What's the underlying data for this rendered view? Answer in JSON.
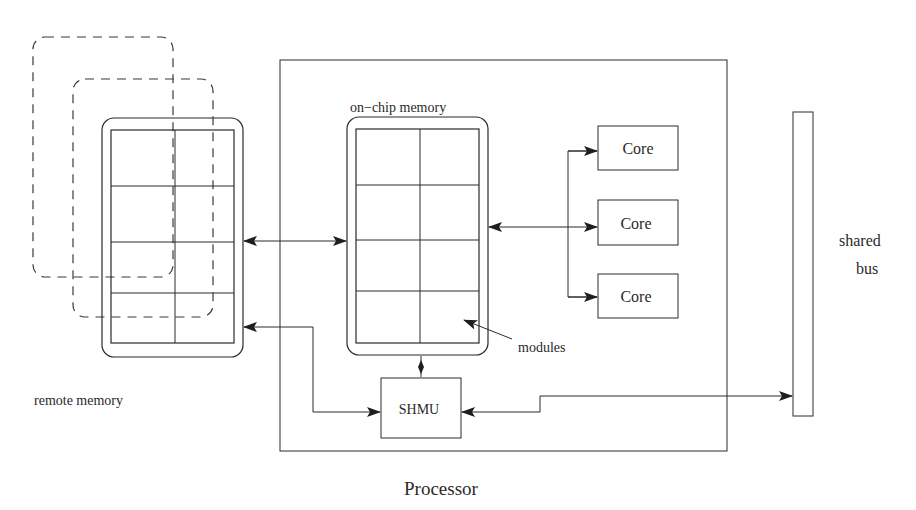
{
  "diagram": {
    "title": "Processor",
    "labels": {
      "remote_memory": "remote memory",
      "on_chip_memory": "on−chip memory",
      "modules": "modules",
      "shmu": "SHMU",
      "shared_bus_line1": "shared",
      "shared_bus_line2": "bus",
      "processor": "Processor"
    },
    "cores": [
      {
        "label": "Core"
      },
      {
        "label": "Core"
      },
      {
        "label": "Core"
      }
    ],
    "memory_grid": {
      "rows": 4,
      "cols": 2
    },
    "remote_memory_stack_count": 3,
    "connections": [
      {
        "from": "remote memory",
        "to": "on-chip memory",
        "type": "bidirectional"
      },
      {
        "from": "on-chip memory",
        "to": "Core",
        "type": "bidirectional"
      },
      {
        "from": "remote memory",
        "to": "SHMU",
        "type": "bidirectional"
      },
      {
        "from": "on-chip memory",
        "to": "SHMU",
        "type": "bidirectional"
      },
      {
        "from": "SHMU",
        "to": "shared bus",
        "type": "bidirectional"
      }
    ],
    "colors": {
      "line": "#2a2a2a",
      "background": "#ffffff"
    }
  }
}
